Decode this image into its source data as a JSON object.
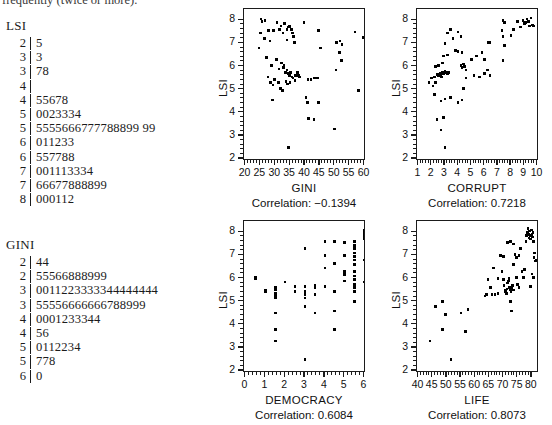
{
  "header": {
    "clipped_text": "frequently (twice or more)."
  },
  "stem_leaf": [
    {
      "name": "stemleaf-lsi",
      "title": "LSI",
      "rows": [
        {
          "stem": "2",
          "leaf": "5"
        },
        {
          "stem": "3",
          "leaf": "3"
        },
        {
          "stem": "3",
          "leaf": "78"
        },
        {
          "stem": "4",
          "leaf": ""
        },
        {
          "stem": "4",
          "leaf": "55678"
        },
        {
          "stem": "5",
          "leaf": "0023334"
        },
        {
          "stem": "5",
          "leaf": "5555666777788899 99"
        },
        {
          "stem": "6",
          "leaf": "011233"
        },
        {
          "stem": "6",
          "leaf": "557788"
        },
        {
          "stem": "7",
          "leaf": "001113334"
        },
        {
          "stem": "7",
          "leaf": "66677888899"
        },
        {
          "stem": "8",
          "leaf": "000112"
        }
      ]
    },
    {
      "name": "stemleaf-gini",
      "title": "GINI",
      "rows": [
        {
          "stem": "2",
          "leaf": "44"
        },
        {
          "stem": "2",
          "leaf": "55566888999"
        },
        {
          "stem": "3",
          "leaf": "0011223333344444444"
        },
        {
          "stem": "3",
          "leaf": "55556666666788999"
        },
        {
          "stem": "4",
          "leaf": "0001233344"
        },
        {
          "stem": "4",
          "leaf": "56"
        },
        {
          "stem": "5",
          "leaf": "0112234"
        },
        {
          "stem": "5",
          "leaf": "778"
        },
        {
          "stem": "6",
          "leaf": "0"
        }
      ]
    }
  ],
  "chart_data": [
    {
      "name": "scatter-gini",
      "type": "scatter",
      "title": "",
      "xlabel": "GINI",
      "ylabel": "LSI",
      "correlation": -0.1394,
      "correlation_label": "Correlation: −0.1394",
      "xlim": [
        20,
        60
      ],
      "ylim": [
        2,
        8.4
      ],
      "xticks": [
        20,
        25,
        30,
        35,
        40,
        45,
        50,
        55,
        60
      ],
      "yticks": [
        2,
        3,
        4,
        5,
        6,
        7,
        8
      ],
      "minor_ticks": true,
      "grid": false,
      "points": [
        [
          25.2,
          8.05
        ],
        [
          25.6,
          7.95
        ],
        [
          26.5,
          8.0
        ],
        [
          25.0,
          7.45
        ],
        [
          26.3,
          7.2
        ],
        [
          24.6,
          6.8
        ],
        [
          27.8,
          7.55
        ],
        [
          28.2,
          7.1
        ],
        [
          29.4,
          7.55
        ],
        [
          30.6,
          7.9
        ],
        [
          31.4,
          7.6
        ],
        [
          32.0,
          7.75
        ],
        [
          32.6,
          7.45
        ],
        [
          33.2,
          7.85
        ],
        [
          33.9,
          7.6
        ],
        [
          34.5,
          7.7
        ],
        [
          34.8,
          7.72
        ],
        [
          35.4,
          7.6
        ],
        [
          35.8,
          7.45
        ],
        [
          36.2,
          7.3
        ],
        [
          34.0,
          7.15
        ],
        [
          36.4,
          7.05
        ],
        [
          39.6,
          7.9
        ],
        [
          44.5,
          7.55
        ],
        [
          45.2,
          6.8
        ],
        [
          50.6,
          7.05
        ],
        [
          51.8,
          7.1
        ],
        [
          52.4,
          6.95
        ],
        [
          51.6,
          6.6
        ],
        [
          56.8,
          7.5
        ],
        [
          59.6,
          7.25
        ],
        [
          60.2,
          6.45
        ],
        [
          52.2,
          6.25
        ],
        [
          50.4,
          5.85
        ],
        [
          27.0,
          6.4
        ],
        [
          28.8,
          6.05
        ],
        [
          30.4,
          6.3
        ],
        [
          31.2,
          5.9
        ],
        [
          32.2,
          6.15
        ],
        [
          32.8,
          5.95
        ],
        [
          33.0,
          6.05
        ],
        [
          33.4,
          5.75
        ],
        [
          34.0,
          5.85
        ],
        [
          34.4,
          5.7
        ],
        [
          34.8,
          5.6
        ],
        [
          35.2,
          5.75
        ],
        [
          35.6,
          5.55
        ],
        [
          36.0,
          5.5
        ],
        [
          36.8,
          5.6
        ],
        [
          37.4,
          5.75
        ],
        [
          37.8,
          5.6
        ],
        [
          38.2,
          5.55
        ],
        [
          27.6,
          5.55
        ],
        [
          28.4,
          5.3
        ],
        [
          29.2,
          5.2
        ],
        [
          29.8,
          5.45
        ],
        [
          31.0,
          5.3
        ],
        [
          31.8,
          5.05
        ],
        [
          32.4,
          4.95
        ],
        [
          33.6,
          5.35
        ],
        [
          34.2,
          5.25
        ],
        [
          35.0,
          5.3
        ],
        [
          36.6,
          5.4
        ],
        [
          41.0,
          5.45
        ],
        [
          42.0,
          5.45
        ],
        [
          43.2,
          5.5
        ],
        [
          44.2,
          5.5
        ],
        [
          29.0,
          4.55
        ],
        [
          40.4,
          4.65
        ],
        [
          40.8,
          4.45
        ],
        [
          44.6,
          4.45
        ],
        [
          41.2,
          3.75
        ],
        [
          43.0,
          3.7
        ],
        [
          50.0,
          3.3
        ],
        [
          34.4,
          2.5
        ],
        [
          58.0,
          4.95
        ]
      ]
    },
    {
      "name": "scatter-corrupt",
      "type": "scatter",
      "title": "",
      "xlabel": "CORRUPT",
      "ylabel": "LSI",
      "correlation": 0.7218,
      "correlation_label": "Correlation: 0.7218",
      "xlim": [
        1,
        10
      ],
      "ylim": [
        2,
        8.4
      ],
      "xticks": [
        1,
        2,
        3,
        4,
        5,
        6,
        7,
        8,
        9,
        10
      ],
      "yticks": [
        2,
        3,
        4,
        5,
        6,
        7,
        8
      ],
      "minor_ticks": true,
      "grid": false,
      "points": [
        [
          1.8,
          5.3
        ],
        [
          2.0,
          5.5
        ],
        [
          2.1,
          5.15
        ],
        [
          2.2,
          5.55
        ],
        [
          2.3,
          5.3
        ],
        [
          2.4,
          5.65
        ],
        [
          2.5,
          5.6
        ],
        [
          2.6,
          5.65
        ],
        [
          2.65,
          5.7
        ],
        [
          2.7,
          5.6
        ],
        [
          2.75,
          5.55
        ],
        [
          2.8,
          5.75
        ],
        [
          2.9,
          5.7
        ],
        [
          3.0,
          5.8
        ],
        [
          3.1,
          5.75
        ],
        [
          3.2,
          5.7
        ],
        [
          3.3,
          5.75
        ],
        [
          2.3,
          6.0
        ],
        [
          2.5,
          6.05
        ],
        [
          2.8,
          6.15
        ],
        [
          2.9,
          6.45
        ],
        [
          3.2,
          6.5
        ],
        [
          3.4,
          7.6
        ],
        [
          3.2,
          7.45
        ],
        [
          3.0,
          7.0
        ],
        [
          3.6,
          7.2
        ],
        [
          4.0,
          7.5
        ],
        [
          4.2,
          7.3
        ],
        [
          4.0,
          6.65
        ],
        [
          3.8,
          6.7
        ],
        [
          4.3,
          6.6
        ],
        [
          4.4,
          6.1
        ],
        [
          4.2,
          6.05
        ],
        [
          4.5,
          6.0
        ],
        [
          4.3,
          5.95
        ],
        [
          4.6,
          5.85
        ],
        [
          5.0,
          6.3
        ],
        [
          5.4,
          6.45
        ],
        [
          5.8,
          6.6
        ],
        [
          6.0,
          6.3
        ],
        [
          6.3,
          7.05
        ],
        [
          6.4,
          7.05
        ],
        [
          6.0,
          5.7
        ],
        [
          6.2,
          5.85
        ],
        [
          6.4,
          5.6
        ],
        [
          5.6,
          5.55
        ],
        [
          5.2,
          5.6
        ],
        [
          4.6,
          5.5
        ],
        [
          7.3,
          7.55
        ],
        [
          7.4,
          8.0
        ],
        [
          7.5,
          7.9
        ],
        [
          7.4,
          7.3
        ],
        [
          7.5,
          6.9
        ],
        [
          7.4,
          6.25
        ],
        [
          8.0,
          7.35
        ],
        [
          8.2,
          7.6
        ],
        [
          8.5,
          7.95
        ],
        [
          8.7,
          7.7
        ],
        [
          8.9,
          8.0
        ],
        [
          9.0,
          7.85
        ],
        [
          9.1,
          7.9
        ],
        [
          9.2,
          8.05
        ],
        [
          9.3,
          7.95
        ],
        [
          9.4,
          7.75
        ],
        [
          9.5,
          8.1
        ],
        [
          9.6,
          7.8
        ],
        [
          9.7,
          7.75
        ],
        [
          2.2,
          4.8
        ],
        [
          2.7,
          4.5
        ],
        [
          3.0,
          4.6
        ],
        [
          3.4,
          4.65
        ],
        [
          4.0,
          4.45
        ],
        [
          4.3,
          4.55
        ],
        [
          4.4,
          5.05
        ],
        [
          2.4,
          3.7
        ],
        [
          2.9,
          3.8
        ],
        [
          2.7,
          3.25
        ],
        [
          3.0,
          2.5
        ]
      ]
    },
    {
      "name": "scatter-democracy",
      "type": "scatter",
      "title": "",
      "xlabel": "DEMOCRACY",
      "ylabel": "LSI",
      "correlation": 0.6084,
      "correlation_label": "Correlation: 0.6084",
      "xlim": [
        0,
        6
      ],
      "ylim": [
        2,
        8.4
      ],
      "xticks": [
        0,
        1,
        2,
        3,
        4,
        5,
        6
      ],
      "yticks": [
        2,
        3,
        4,
        5,
        6,
        7,
        8
      ],
      "minor_ticks": true,
      "grid": false,
      "points": [
        [
          0.5,
          6.05
        ],
        [
          0.5,
          6.0
        ],
        [
          1.0,
          5.5
        ],
        [
          1.0,
          5.45
        ],
        [
          1.5,
          5.6
        ],
        [
          1.5,
          5.5
        ],
        [
          1.5,
          5.35
        ],
        [
          1.5,
          5.25
        ],
        [
          1.5,
          5.2
        ],
        [
          1.5,
          5.15
        ],
        [
          1.5,
          4.5
        ],
        [
          1.5,
          3.8
        ],
        [
          1.5,
          3.3
        ],
        [
          2.0,
          5.85
        ],
        [
          2.5,
          5.65
        ],
        [
          2.5,
          5.45
        ],
        [
          3.0,
          7.3
        ],
        [
          3.0,
          5.65
        ],
        [
          3.0,
          5.45
        ],
        [
          3.0,
          5.3
        ],
        [
          3.0,
          5.15
        ],
        [
          3.0,
          4.8
        ],
        [
          3.0,
          2.5
        ],
        [
          3.5,
          5.7
        ],
        [
          3.5,
          5.6
        ],
        [
          3.5,
          5.3
        ],
        [
          3.5,
          4.5
        ],
        [
          4.0,
          7.6
        ],
        [
          4.0,
          7.0
        ],
        [
          4.0,
          6.45
        ],
        [
          4.0,
          5.65
        ],
        [
          4.5,
          7.6
        ],
        [
          4.5,
          6.65
        ],
        [
          4.5,
          5.45
        ],
        [
          4.5,
          4.6
        ],
        [
          4.5,
          3.8
        ],
        [
          5.0,
          7.55
        ],
        [
          5.0,
          7.0
        ],
        [
          5.0,
          6.3
        ],
        [
          5.0,
          6.2
        ],
        [
          5.0,
          6.15
        ],
        [
          5.0,
          5.9
        ],
        [
          5.5,
          7.6
        ],
        [
          5.5,
          7.45
        ],
        [
          5.5,
          7.35
        ],
        [
          5.5,
          7.3
        ],
        [
          5.5,
          7.1
        ],
        [
          5.5,
          6.95
        ],
        [
          5.5,
          6.8
        ],
        [
          5.5,
          6.6
        ],
        [
          5.5,
          6.3
        ],
        [
          5.5,
          6.1
        ],
        [
          5.5,
          5.95
        ],
        [
          5.5,
          5.75
        ],
        [
          5.5,
          5.6
        ],
        [
          5.5,
          5.45
        ],
        [
          5.5,
          5.0
        ],
        [
          6.0,
          8.1
        ],
        [
          6.0,
          8.0
        ],
        [
          6.0,
          7.9
        ],
        [
          6.0,
          7.8
        ],
        [
          6.0,
          7.7
        ],
        [
          6.0,
          6.8
        ],
        [
          6.0,
          5.85
        ]
      ]
    },
    {
      "name": "scatter-life",
      "type": "scatter",
      "title": "",
      "xlabel": "LIFE",
      "ylabel": "LSI",
      "correlation": 0.8073,
      "correlation_label": "Correlation: 0.8073",
      "xlim": [
        40,
        82
      ],
      "ylim": [
        2,
        8.4
      ],
      "xticks": [
        40,
        45,
        50,
        55,
        60,
        65,
        70,
        75,
        80
      ],
      "yticks": [
        2,
        3,
        4,
        5,
        6,
        7,
        8
      ],
      "minor_ticks": true,
      "grid": false,
      "points": [
        [
          44.0,
          3.3
        ],
        [
          46.0,
          4.8
        ],
        [
          48.5,
          5.0
        ],
        [
          49.5,
          4.45
        ],
        [
          48.5,
          3.8
        ],
        [
          51.5,
          2.5
        ],
        [
          56.5,
          3.7
        ],
        [
          55.0,
          4.5
        ],
        [
          57.5,
          4.65
        ],
        [
          63.5,
          5.25
        ],
        [
          64.0,
          5.3
        ],
        [
          64.5,
          5.95
        ],
        [
          65.5,
          5.6
        ],
        [
          66.5,
          6.45
        ],
        [
          66.0,
          5.3
        ],
        [
          67.0,
          5.3
        ],
        [
          68.0,
          5.35
        ],
        [
          69.0,
          7.0
        ],
        [
          69.5,
          6.3
        ],
        [
          70.0,
          5.95
        ],
        [
          70.2,
          5.7
        ],
        [
          70.5,
          5.5
        ],
        [
          70.8,
          5.45
        ],
        [
          71.0,
          5.35
        ],
        [
          71.2,
          5.55
        ],
        [
          71.5,
          5.8
        ],
        [
          71.8,
          5.9
        ],
        [
          72.0,
          6.0
        ],
        [
          72.2,
          5.6
        ],
        [
          72.4,
          5.5
        ],
        [
          72.6,
          5.45
        ],
        [
          72.8,
          5.6
        ],
        [
          73.0,
          5.55
        ],
        [
          73.2,
          5.7
        ],
        [
          73.5,
          5.5
        ],
        [
          72.5,
          5.0
        ],
        [
          72.8,
          4.6
        ],
        [
          71.5,
          7.55
        ],
        [
          72.5,
          7.6
        ],
        [
          73.5,
          7.5
        ],
        [
          74.0,
          7.05
        ],
        [
          73.5,
          6.6
        ],
        [
          74.5,
          6.05
        ],
        [
          75.0,
          5.75
        ],
        [
          75.5,
          5.6
        ],
        [
          74.5,
          6.9
        ],
        [
          75.5,
          7.0
        ],
        [
          76.0,
          7.3
        ],
        [
          76.5,
          6.3
        ],
        [
          77.0,
          6.05
        ],
        [
          77.5,
          6.4
        ],
        [
          78.0,
          7.6
        ],
        [
          78.2,
          7.85
        ],
        [
          78.4,
          8.0
        ],
        [
          78.6,
          8.15
        ],
        [
          78.8,
          7.9
        ],
        [
          79.0,
          7.75
        ],
        [
          79.2,
          8.05
        ],
        [
          79.4,
          7.85
        ],
        [
          79.6,
          7.7
        ],
        [
          79.8,
          8.1
        ],
        [
          80.0,
          7.9
        ],
        [
          80.2,
          7.8
        ],
        [
          80.4,
          8.0
        ],
        [
          80.6,
          7.6
        ],
        [
          80.8,
          6.9
        ],
        [
          81.0,
          7.1
        ],
        [
          81.2,
          6.75
        ],
        [
          81.5,
          6.8
        ],
        [
          80.0,
          6.2
        ],
        [
          80.5,
          6.05
        ],
        [
          79.5,
          5.65
        ],
        [
          68.0,
          6.0
        ],
        [
          70.0,
          6.95
        ]
      ]
    }
  ]
}
